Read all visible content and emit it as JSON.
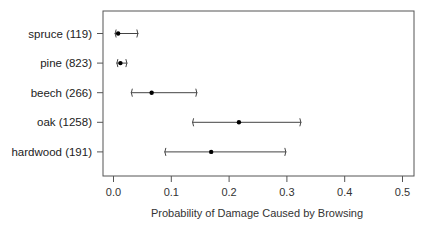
{
  "chart_data": {
    "type": "interval",
    "title": "",
    "xlabel": "Probability of Damage Caused by Browsing",
    "ylabel": "",
    "xlim": [
      -0.018,
      0.522
    ],
    "xticks": [
      0.0,
      0.1,
      0.2,
      0.3,
      0.4,
      0.5
    ],
    "xtick_labels": [
      "0.0",
      "0.1",
      "0.2",
      "0.3",
      "0.4",
      "0.5"
    ],
    "grid": false,
    "legend": null,
    "categories": [
      "spruce (119)",
      "pine (823)",
      "beech (266)",
      "oak (1258)",
      "hardwood (191)"
    ],
    "series": [
      {
        "name": "estimate",
        "values": [
          0.008,
          0.012,
          0.066,
          0.217,
          0.169
        ]
      },
      {
        "name": "lower",
        "values": [
          0.002,
          0.005,
          0.03,
          0.136,
          0.088
        ]
      },
      {
        "name": "upper",
        "values": [
          0.043,
          0.024,
          0.145,
          0.325,
          0.299
        ]
      }
    ]
  },
  "colors": {
    "axis": "#555555",
    "point": "#000000",
    "interval": "#444444",
    "text": "#222222"
  }
}
